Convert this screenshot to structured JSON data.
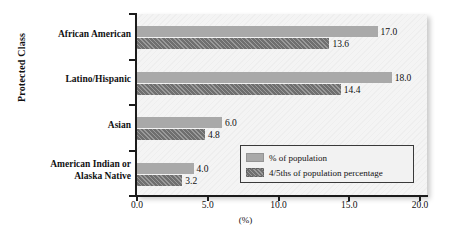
{
  "chart_data": {
    "type": "bar",
    "orientation": "horizontal",
    "title": "",
    "xlabel": "(%)",
    "ylabel": "Protected Class",
    "xlim": [
      0,
      20
    ],
    "xticks": [
      "0.0",
      "5.0",
      "10.0",
      "15.0",
      "20.0"
    ],
    "xtick_values": [
      0,
      5,
      10,
      15,
      20
    ],
    "grid": false,
    "legend_position": "inside-bottom-right",
    "categories": [
      "African American",
      "Latino/Hispanic",
      "Asian",
      "American Indian or Alaska Native"
    ],
    "category_lines": [
      [
        "African American"
      ],
      [
        "Latino/Hispanic"
      ],
      [
        "Asian"
      ],
      [
        "American Indian or",
        "Alaska Native"
      ]
    ],
    "series": [
      {
        "name": "% of population",
        "color": "#a9a9a9",
        "values": [
          17.0,
          18.0,
          6.0,
          4.0
        ],
        "labels": [
          "17.0",
          "18.0",
          "6.0",
          "4.0"
        ]
      },
      {
        "name": "4/5ths of population percentage",
        "color": "#6f6f6f",
        "values": [
          13.6,
          14.4,
          4.8,
          3.2
        ],
        "labels": [
          "13.6",
          "14.4",
          "4.8",
          "3.2"
        ]
      }
    ]
  },
  "colors": {
    "series_light": "#a9a9a9",
    "series_dark": "#6f6f6f",
    "plot_background": "#f4f4f4",
    "axis": "#1b1b1b",
    "text": "#111111"
  }
}
